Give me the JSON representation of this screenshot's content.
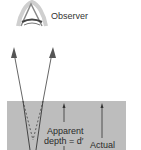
{
  "diagram": {
    "labels": {
      "observer": "Observer",
      "apparent_line1": "Apparent",
      "apparent_line2": "depth = d′",
      "actual": "Actual"
    },
    "colors": {
      "background": "#ffffff",
      "water": "#bdbdbd",
      "rays": "#555555",
      "text": "#2a2a2a"
    },
    "elements": [
      {
        "name": "observer-eye",
        "type": "icon"
      },
      {
        "name": "ray-left",
        "type": "arrow",
        "direction": "up"
      },
      {
        "name": "ray-right",
        "type": "arrow",
        "direction": "up"
      },
      {
        "name": "water-region",
        "type": "rect"
      },
      {
        "name": "apparent-depth-arrow",
        "type": "arrow",
        "direction": "up"
      },
      {
        "name": "actual-depth-arrow",
        "type": "arrow",
        "direction": "up"
      }
    ]
  }
}
